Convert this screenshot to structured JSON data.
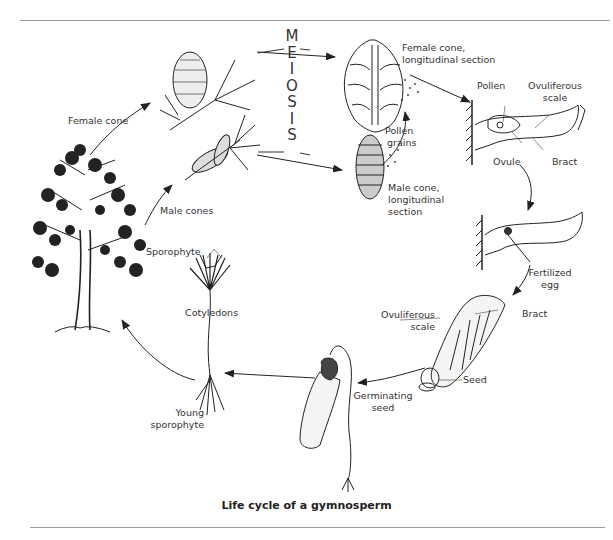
{
  "title": "Life cycle of a gymnosperm",
  "meiosis_letters": [
    "M",
    "E",
    "I",
    "O",
    "S",
    "I",
    "S"
  ],
  "labels": {
    "female_cone": "Female cone",
    "male_cones": "Male cones",
    "sporophyte": "Sporophyte",
    "female_cone_section_1": "Female cone,",
    "female_cone_section_2": "longitudinal section",
    "pollen_grains_1": "Pollen",
    "pollen_grains_2": "grains",
    "male_cone_section_1": "Male cone,",
    "male_cone_section_2": "longitudinal",
    "male_cone_section_3": "section",
    "pollen": "Pollen",
    "ovuliferous_scale_1": "Ovuliferous",
    "ovuliferous_scale_2": "scale",
    "ovule": "Ovule",
    "bract": "Bract",
    "fertilized_egg_1": "Fertilized",
    "fertilized_egg_2": "egg",
    "ovuliferous_scale_b_1": "Ovuliferous",
    "ovuliferous_scale_b_2": "scale",
    "bract_b": "Bract",
    "seed": "Seed",
    "germinating_seed_1": "Germinating",
    "germinating_seed_2": "seed",
    "cotyledons": "Cotyledons",
    "young_sporophyte_1": "Young",
    "young_sporophyte_2": "sporophyte"
  },
  "stages": [
    "Sporophyte",
    "Female cone",
    "Male cones",
    "Meiosis",
    "Female cone, longitudinal section",
    "Male cone, longitudinal section",
    "Pollen grains",
    "Pollination (ovule on ovuliferous scale)",
    "Fertilized egg",
    "Seed",
    "Germinating seed",
    "Young sporophyte"
  ]
}
